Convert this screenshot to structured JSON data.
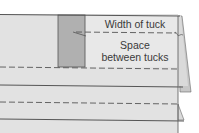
{
  "diagram": {
    "labels": {
      "width_of_tuck": "Width of tuck",
      "space_line1": "Space",
      "space_line2": "between tucks"
    },
    "colors": {
      "background": "#ffffff",
      "fabric": "#e2e2e2",
      "fabric_light": "#e8e8e8",
      "tuck_shaded": "#b0b0b0",
      "fold_shadow": "#c8c8c8",
      "outline": "#555555",
      "dashed_stitch": "#555555",
      "text": "#3a3a3a"
    }
  }
}
